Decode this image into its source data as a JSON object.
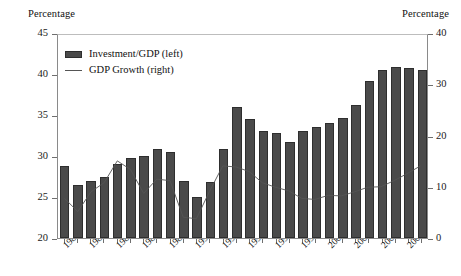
{
  "axis_titles": {
    "left": "Percentage",
    "right": "Percentage"
  },
  "legend": {
    "bar_label": "Investment/GDP (left)",
    "line_label": "GDP Growth (right)"
  },
  "colors": {
    "bar_fill": "#4a4a4a",
    "bar_stroke": "#2e2e2e",
    "line": "#555555",
    "axis": "#8a8a8a",
    "text": "#111111"
  },
  "chart_data": {
    "type": "bar",
    "title": "",
    "subtitle": "",
    "xlabel": "",
    "ylabel": "Percentage",
    "y2label": "Percentage",
    "ylim": [
      20,
      45
    ],
    "y2lim": [
      0,
      40
    ],
    "yticks": [
      20,
      25,
      30,
      35,
      40,
      45
    ],
    "y2ticks": [
      0,
      10,
      20,
      30,
      40
    ],
    "grid": false,
    "legend_position": "upper-left-inside",
    "categories": [
      1980,
      1981,
      1982,
      1983,
      1984,
      1985,
      1986,
      1987,
      1988,
      1989,
      1990,
      1991,
      1992,
      1993,
      1994,
      1995,
      1996,
      1997,
      1998,
      1999,
      2000,
      2001,
      2002,
      2003,
      2004,
      2005,
      2006,
      2007
    ],
    "xtick_labels": [
      "1980",
      "1982",
      "1984",
      "1986",
      "1988",
      "1990",
      "1992",
      "1994",
      "1996",
      "1998",
      "2000",
      "2002",
      "2004",
      "2006"
    ],
    "series": [
      {
        "name": "Investment/GDP (left)",
        "type": "bar",
        "axis": "left",
        "values": [
          28.8,
          26.5,
          27.0,
          27.5,
          29.0,
          29.8,
          30.0,
          30.8,
          30.5,
          27.0,
          25.0,
          26.8,
          30.8,
          36.0,
          34.5,
          33.0,
          32.8,
          31.7,
          33.1,
          33.5,
          34.0,
          34.6,
          36.2,
          39.1,
          40.5,
          40.8,
          40.7,
          40.5
        ]
      },
      {
        "name": "GDP Growth (right)",
        "type": "line",
        "axis": "right",
        "values": [
          7.8,
          5.2,
          9.1,
          10.9,
          15.2,
          13.5,
          8.8,
          11.6,
          11.3,
          4.1,
          3.8,
          9.2,
          14.2,
          14.0,
          13.1,
          10.9,
          10.0,
          9.3,
          7.8,
          7.6,
          8.4,
          8.3,
          9.1,
          10.0,
          10.1,
          11.3,
          12.7,
          14.2
        ]
      }
    ]
  }
}
